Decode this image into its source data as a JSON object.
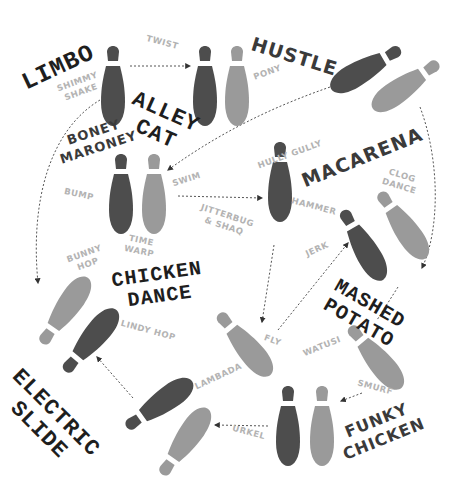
{
  "colors": {
    "dark_shoe": "#4d4d4d",
    "light_shoe": "#9a9a9a",
    "primary_label": "#1e1e1e",
    "secondary_label": "#3a3a3a",
    "minor_label": "#b3b3b3",
    "arrow": "#555555"
  },
  "major_dances": {
    "limbo": "LIMBO",
    "hustle": "HUSTLE",
    "alley_cat": "ALLEY\nCAT",
    "boney_maroney": "BONEY\nMARONEY",
    "macarena": "MACARENA",
    "chicken_dance": "CHICKEN\nDANCE",
    "mashed_potato": "MASHED\nPOTATO",
    "electric_slide": "ELECTRIC\nSLIDE",
    "funky_chicken": "FUNKY\nCHICKEN"
  },
  "minor_dances": {
    "twist": "TWIST",
    "pony": "PONY",
    "shimmy_shake": "SHIMMY\nSHAKE",
    "hully_gully": "HULLY GULLY",
    "clog_dance": "CLOG\nDANCE",
    "bump": "BUMP",
    "swim": "SWIM",
    "hammer": "HAMMER",
    "jitterbug_shaq": "JITTERBUG\n& SHAQ",
    "time_warp": "TIME\nWARP",
    "bunny_hop": "BUNNY\nHOP",
    "jerk": "JERK",
    "lindy_hop": "LINDY HOP",
    "fly": "FLY",
    "watusi": "WATUSI",
    "lambada": "LAMBADA",
    "smurf": "SMURF",
    "urkel": "URKEL"
  }
}
